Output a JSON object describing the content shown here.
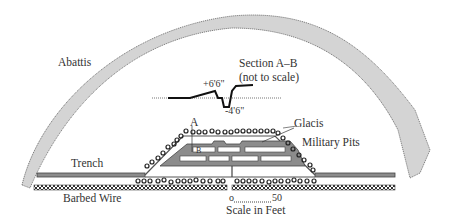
{
  "labels": {
    "abattis": "Abattis",
    "section_title": "Section A–B",
    "section_note": "(not to scale)",
    "height_plus": "+6'6\"",
    "height_minus": "-4'6\"",
    "point_a": "A",
    "point_b": "B",
    "glacis": "Glacis",
    "military_pits": "Military Pits",
    "trench": "Trench",
    "barbed_wire": "Barbed Wire",
    "scale_start": "o",
    "scale_end": "50",
    "scale_caption": "Scale in Feet"
  },
  "colors": {
    "abattis_fill": "#d4d4d4",
    "outline": "#555555",
    "fort_fill": "#8c8c8c",
    "trench_fill": "#8c8c8c",
    "wire_fill": "#444444",
    "text": "#333333"
  }
}
